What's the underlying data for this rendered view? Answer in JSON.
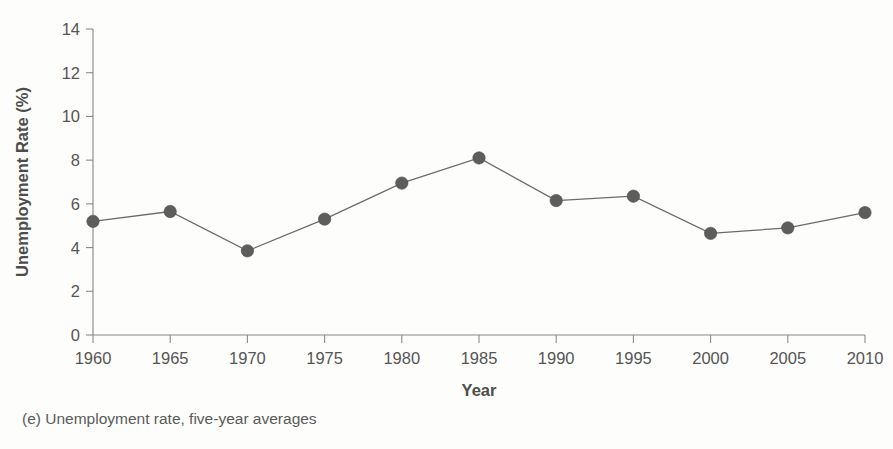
{
  "caption": "(e) Unemployment rate, five-year averages",
  "chart_data": {
    "type": "line",
    "title": "",
    "subtitle": "",
    "xlabel": "Year",
    "ylabel": "Unemployment Rate (%)",
    "x": [
      1960,
      1965,
      1970,
      1975,
      1980,
      1985,
      1990,
      1995,
      2000,
      2005,
      2010
    ],
    "categories": [
      "1960",
      "1965",
      "1970",
      "1975",
      "1980",
      "1985",
      "1990",
      "1995",
      "2000",
      "2005",
      "2010"
    ],
    "values": [
      5.2,
      5.65,
      3.85,
      5.3,
      6.95,
      8.1,
      6.15,
      6.35,
      4.65,
      4.9,
      5.6
    ],
    "series": [
      {
        "name": "Unemployment rate",
        "values": [
          5.2,
          5.65,
          3.85,
          5.3,
          6.95,
          8.1,
          6.15,
          6.35,
          4.65,
          4.9,
          5.6
        ]
      }
    ],
    "xlim": [
      1960,
      2010
    ],
    "ylim": [
      0,
      14
    ],
    "ytick_labels": [
      "0",
      "2",
      "4",
      "6",
      "8",
      "10",
      "12",
      "14"
    ],
    "yticks": [
      0,
      2,
      4,
      6,
      8,
      10,
      12,
      14
    ],
    "xtick_labels": [
      "1960",
      "1965",
      "1970",
      "1975",
      "1980",
      "1985",
      "1990",
      "1995",
      "2000",
      "2005",
      "2010"
    ],
    "xticks": [
      1960,
      1965,
      1970,
      1975,
      1980,
      1985,
      1990,
      1995,
      2000,
      2005,
      2010
    ],
    "grid": false,
    "legend": "none",
    "marker": "circle",
    "line_color": "#6b6b6b",
    "marker_color": "#5d5d5d",
    "axis_color": "#8a8a8a",
    "background_color": "#fdfdfb"
  }
}
